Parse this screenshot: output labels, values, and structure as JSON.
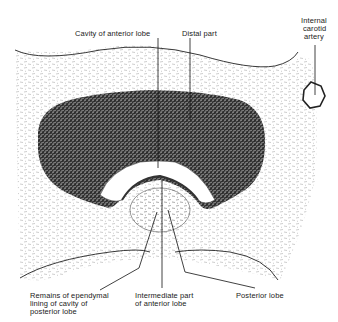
{
  "figure": {
    "labels": {
      "cavity_anterior_lobe": "Cavity of anterior lobe",
      "distal_part": "Distal part",
      "internal_carotid_line1": "Internal",
      "internal_carotid_line2": "carotid",
      "internal_carotid_line3": "artery",
      "remains_line1": "Remains of ependymal",
      "remains_line2": "lining of cavity of",
      "remains_line3": "posterior lobe",
      "intermediate_line1": "Intermediate part",
      "intermediate_line2": "of anterior lobe",
      "posterior_lobe": "Posterior lobe"
    }
  }
}
